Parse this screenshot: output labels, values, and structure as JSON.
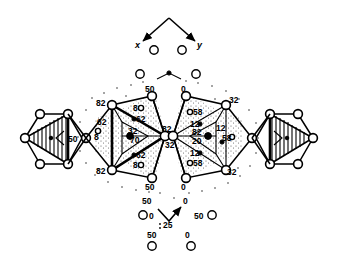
{
  "figure": {
    "axes": {
      "x_label": "x",
      "y_label": "y",
      "z_label": "25"
    },
    "left_polyhedron": {
      "center_label": "50",
      "vertex_labels": [
        "82",
        "50",
        "82",
        "82",
        "50"
      ],
      "interior_labels": [
        "32",
        "70",
        "62",
        "62",
        "8",
        "8",
        "62",
        "8"
      ]
    },
    "right_polyhedron": {
      "vertex_labels": [
        "0",
        "32",
        "32",
        "0",
        "32"
      ],
      "interior_labels": [
        "58",
        "12",
        "82",
        "20",
        "12",
        "58",
        "12",
        "58"
      ]
    },
    "left_cluster_label": "50",
    "bottom_atoms": [
      "0",
      "50",
      "50",
      "0",
      "50",
      "0"
    ],
    "top_atoms": [
      "",
      ""
    ],
    "labels": {
      "l_top_50": "50",
      "l_ul_82": "82",
      "l_ll_82": "82",
      "l_bot_50": "50",
      "l_mid_82": "82",
      "l_left_62": "62",
      "l_left_8": "8",
      "l_in_32": "32",
      "l_in_70": "70",
      "l_in_62a": "62",
      "l_in_62b": "62",
      "l_in_8a": "8",
      "l_in_8b": "8",
      "l_hex_50": "50",
      "r_top_0": "0",
      "r_bot_0": "0",
      "r_mid_32": "32",
      "r_ur_32": "32",
      "r_lr_32": "32",
      "r_in_58a": "58",
      "r_in_12a": "12",
      "r_in_82": "82",
      "r_in_20": "20",
      "r_in_12b": "12",
      "r_in_58b": "58",
      "r_in_12c": "12",
      "r_in_58c": "58",
      "b_left_0": "0",
      "b_right_50": "50",
      "b_z_25": "25",
      "b_lower_50": "50",
      "b_lower_0": "0"
    },
    "colors": {
      "line": "#000000",
      "fill": "#ffffff",
      "stipple": "#7a7a7a"
    }
  }
}
